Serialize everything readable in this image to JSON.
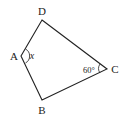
{
  "diagram": {
    "type": "quadrilateral",
    "vertices": [
      {
        "name": "D",
        "x": 42,
        "y": 20,
        "label_x": 42,
        "label_y": 15
      },
      {
        "name": "A",
        "x": 21,
        "y": 56,
        "label_x": 13,
        "label_y": 60
      },
      {
        "name": "B",
        "x": 42,
        "y": 100,
        "label_x": 42,
        "label_y": 114
      },
      {
        "name": "C",
        "x": 107,
        "y": 69,
        "label_x": 114,
        "label_y": 73
      }
    ],
    "labels": {
      "D": "D",
      "A": "A",
      "B": "B",
      "C": "C",
      "angle_A": "x",
      "angle_C": "60°"
    },
    "stroke_color": "#222222"
  }
}
